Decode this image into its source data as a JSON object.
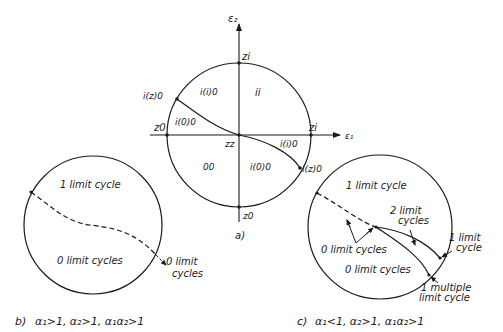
{
  "figure": {
    "panel_a": {
      "caption": "a)",
      "axis_x_label": "ε₁",
      "axis_y_label": "ε₂",
      "points": {
        "top": "zi",
        "right": "zi",
        "bottom": "z0",
        "left": "z0",
        "origin": "zz",
        "upper_left_boundary": "i(z)0",
        "lower_right_boundary": "i(z)0"
      },
      "regions": {
        "upper_left": "i(i)0",
        "upper_right": "ii",
        "left_wedge": "i(0)0",
        "lower_left": "00",
        "lower_right": "i(0)0",
        "right_wedge": "i(i)0"
      }
    },
    "panel_b": {
      "caption": "b)",
      "condition": "α₁>1, α₂>1, α₁α₂>1",
      "upper_region": "1 limit cycle",
      "lower_region": "0 limit cycles",
      "outside_label_line1": "0 limit",
      "outside_label_line2": "cycles"
    },
    "panel_c": {
      "caption": "c)",
      "condition": "α₁<1, α₂>1, α₁α₂>1",
      "upper_region": "1 limit cycle",
      "middle_label_line1": "2 limit",
      "middle_label_line2": "cycles",
      "arrow_label": "0 limit cycles",
      "lower_region": "0 limit cycles",
      "right_label_line1": "1 limit",
      "right_label_line2": "cycle",
      "bottom_label_line1": "1 multiple",
      "bottom_label_line2": "limit cycle"
    }
  }
}
